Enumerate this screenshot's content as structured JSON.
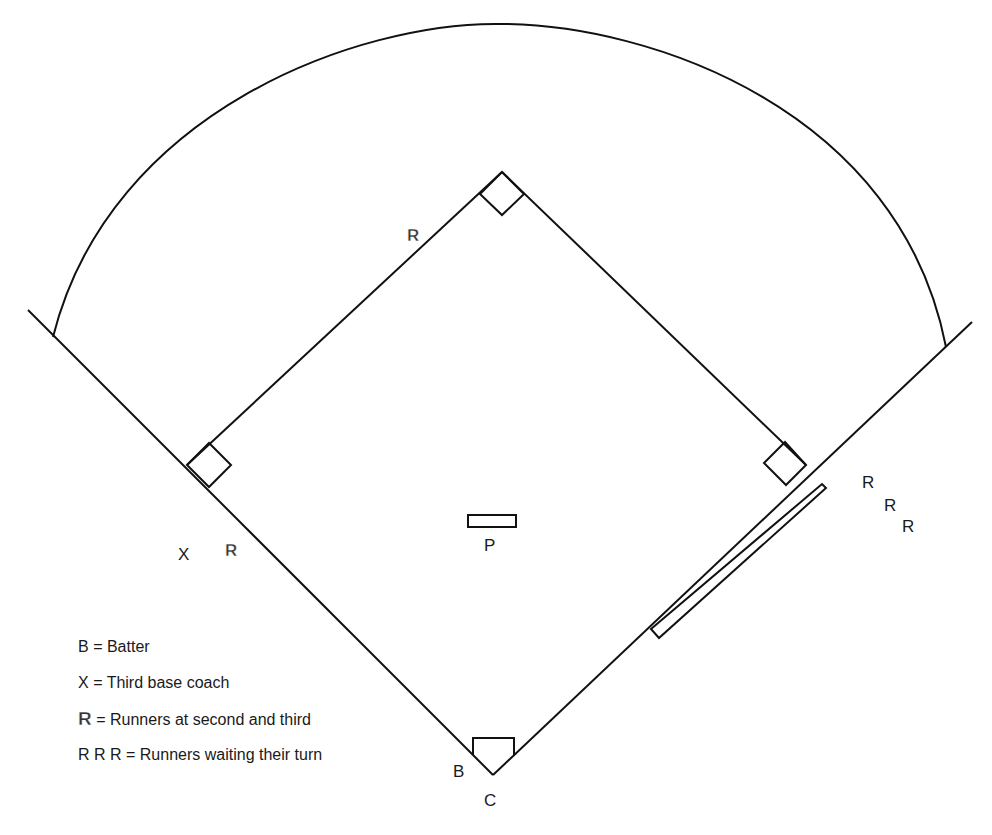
{
  "diagram": {
    "labels": {
      "second_base_runner": "R",
      "third_base_runner": "R",
      "third_base_coach": "X",
      "pitcher": "P",
      "batter": "B",
      "catcher": "C",
      "waiting_runners": [
        "R",
        "R",
        "R"
      ]
    },
    "legend": [
      {
        "key": "B",
        "text": "= Batter"
      },
      {
        "key": "X",
        "text": "= Third base coach"
      },
      {
        "key": "R",
        "text": "= Runners at second and third",
        "outlined": true
      },
      {
        "key": "R R R",
        "text": "= Runners waiting their turn"
      }
    ],
    "stroke_color": "#111111"
  }
}
